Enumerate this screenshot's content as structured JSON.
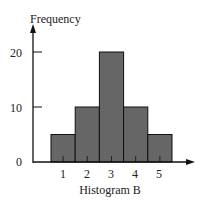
{
  "chart_data": {
    "type": "bar",
    "title": "",
    "xlabel": "Histogram B",
    "ylabel": "Frequency",
    "categories": [
      "1",
      "2",
      "3",
      "4",
      "5"
    ],
    "values": [
      5,
      10,
      20,
      10,
      5
    ],
    "yticks": [
      "0",
      "10",
      "20"
    ],
    "ylim": [
      0,
      22
    ],
    "grid": false,
    "bar_color": "#666666",
    "edge_color": "#111111"
  }
}
